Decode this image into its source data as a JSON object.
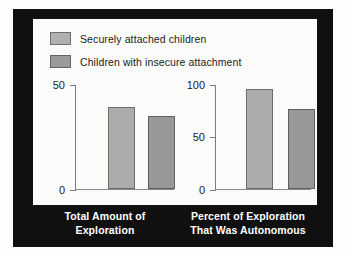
{
  "figure": {
    "frame_color": "#111010",
    "panel_color": "#fbfbfa"
  },
  "legend": {
    "items": [
      {
        "label": "Securely attached children",
        "swatch_color": "#b0b0b0",
        "key": "secure"
      },
      {
        "label": "Children with insecure attachment",
        "swatch_color": "#9a9a9a",
        "key": "insecure"
      }
    ]
  },
  "left_chart": {
    "caption_line1": "Total Amount of",
    "caption_line2": "Exploration",
    "ticks": [
      "0",
      "50"
    ]
  },
  "right_chart": {
    "caption_line1": "Percent of Exploration",
    "caption_line2": "That Was Autonomous",
    "ticks": [
      "0",
      "50",
      "100"
    ]
  },
  "chart_data": [
    {
      "type": "bar",
      "title": "Total Amount of Exploration",
      "xlabel": "Total Amount of Exploration",
      "ylabel": "",
      "categories": [
        "Total Amount of Exploration"
      ],
      "series": [
        {
          "name": "Securely attached children",
          "values": [
            39
          ],
          "color": "#acacac"
        },
        {
          "name": "Children with insecure attachment",
          "values": [
            35
          ],
          "color": "#989898"
        }
      ],
      "ylim": [
        0,
        50
      ],
      "yticks": [
        0,
        50
      ],
      "grid": false,
      "legend_position": "top-left"
    },
    {
      "type": "bar",
      "title": "Percent of Exploration That Was Autonomous",
      "xlabel": "Percent of Exploration That Was Autonomous",
      "ylabel": "",
      "categories": [
        "Percent of Exploration That Was Autonomous"
      ],
      "series": [
        {
          "name": "Securely attached children",
          "values": [
            95
          ],
          "color": "#acacac"
        },
        {
          "name": "Children with insecure attachment",
          "values": [
            76
          ],
          "color": "#989898"
        }
      ],
      "ylim": [
        0,
        100
      ],
      "yticks": [
        0,
        50,
        100
      ],
      "grid": false,
      "legend_position": "top-left"
    }
  ]
}
